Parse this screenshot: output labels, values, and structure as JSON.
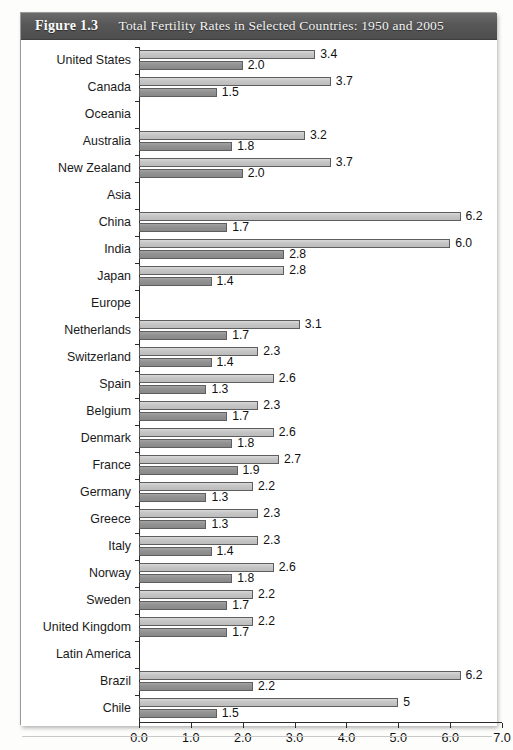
{
  "figure": {
    "number": "Figure 1.3",
    "title": "Total Fertility Rates in Selected Countries: 1950 and 2005"
  },
  "chart_data": {
    "type": "bar",
    "orientation": "horizontal",
    "title": "Total Fertility Rates in Selected Countries: 1950 and 2005",
    "xlabel": "",
    "ylabel": "",
    "xlim": [
      0.0,
      7.0
    ],
    "xticks": [
      "0.0",
      "1.0",
      "2.0",
      "3.0",
      "4.0",
      "5.0",
      "6.0",
      "7.0"
    ],
    "grid": false,
    "legend_position": "bottom",
    "colors": {
      "series_1950_1955": "#c6c6c6",
      "series_2005_2010": "#929292",
      "caption_bar": "#575757",
      "axis": "#2b2b2b"
    },
    "series": [
      {
        "name": "1950–1955",
        "key": "old"
      },
      {
        "name": "2005–2010",
        "key": "new"
      }
    ],
    "categories": [
      "United States",
      "Canada",
      "Oceania",
      "Australia",
      "New Zealand",
      "Asia",
      "China",
      "India",
      "Japan",
      "Europe",
      "Netherlands",
      "Switzerland",
      "Spain",
      "Belgium",
      "Denmark",
      "France",
      "Germany",
      "Greece",
      "Italy",
      "Norway",
      "Sweden",
      "United Kingdom",
      "Latin America",
      "Brazil",
      "Chile"
    ],
    "rows": [
      {
        "label": "United States",
        "group": false,
        "old": 3.4,
        "new": 2.0,
        "old_label": "3.4",
        "new_label": "2.0"
      },
      {
        "label": "Canada",
        "group": false,
        "old": 3.7,
        "new": 1.5,
        "old_label": "3.7",
        "new_label": "1.5"
      },
      {
        "label": "Oceania",
        "group": true,
        "old": null,
        "new": null,
        "old_label": "",
        "new_label": ""
      },
      {
        "label": "Australia",
        "group": false,
        "old": 3.2,
        "new": 1.8,
        "old_label": "3.2",
        "new_label": "1.8"
      },
      {
        "label": "New Zealand",
        "group": false,
        "old": 3.7,
        "new": 2.0,
        "old_label": "3.7",
        "new_label": "2.0"
      },
      {
        "label": "Asia",
        "group": true,
        "old": null,
        "new": null,
        "old_label": "",
        "new_label": ""
      },
      {
        "label": "China",
        "group": false,
        "old": 6.2,
        "new": 1.7,
        "old_label": "6.2",
        "new_label": "1.7"
      },
      {
        "label": "India",
        "group": false,
        "old": 6.0,
        "new": 2.8,
        "old_label": "6.0",
        "new_label": "2.8"
      },
      {
        "label": "Japan",
        "group": false,
        "old": 2.8,
        "new": 1.4,
        "old_label": "2.8",
        "new_label": "1.4"
      },
      {
        "label": "Europe",
        "group": true,
        "old": null,
        "new": null,
        "old_label": "",
        "new_label": ""
      },
      {
        "label": "Netherlands",
        "group": false,
        "old": 3.1,
        "new": 1.7,
        "old_label": "3.1",
        "new_label": "1.7"
      },
      {
        "label": "Switzerland",
        "group": false,
        "old": 2.3,
        "new": 1.4,
        "old_label": "2.3",
        "new_label": "1.4"
      },
      {
        "label": "Spain",
        "group": false,
        "old": 2.6,
        "new": 1.3,
        "old_label": "2.6",
        "new_label": "1.3"
      },
      {
        "label": "Belgium",
        "group": false,
        "old": 2.3,
        "new": 1.7,
        "old_label": "2.3",
        "new_label": "1.7"
      },
      {
        "label": "Denmark",
        "group": false,
        "old": 2.6,
        "new": 1.8,
        "old_label": "2.6",
        "new_label": "1.8"
      },
      {
        "label": "France",
        "group": false,
        "old": 2.7,
        "new": 1.9,
        "old_label": "2.7",
        "new_label": "1.9"
      },
      {
        "label": "Germany",
        "group": false,
        "old": 2.2,
        "new": 1.3,
        "old_label": "2.2",
        "new_label": "1.3"
      },
      {
        "label": "Greece",
        "group": false,
        "old": 2.3,
        "new": 1.3,
        "old_label": "2.3",
        "new_label": "1.3"
      },
      {
        "label": "Italy",
        "group": false,
        "old": 2.3,
        "new": 1.4,
        "old_label": "2.3",
        "new_label": "1.4"
      },
      {
        "label": "Norway",
        "group": false,
        "old": 2.6,
        "new": 1.8,
        "old_label": "2.6",
        "new_label": "1.8"
      },
      {
        "label": "Sweden",
        "group": false,
        "old": 2.2,
        "new": 1.7,
        "old_label": "2.2",
        "new_label": "1.7"
      },
      {
        "label": "United Kingdom",
        "group": false,
        "old": 2.2,
        "new": 1.7,
        "old_label": "2.2",
        "new_label": "1.7"
      },
      {
        "label": "Latin America",
        "group": true,
        "old": null,
        "new": null,
        "old_label": "",
        "new_label": ""
      },
      {
        "label": "Brazil",
        "group": false,
        "old": 6.2,
        "new": 2.2,
        "old_label": "6.2",
        "new_label": "2.2"
      },
      {
        "label": "Chile",
        "group": false,
        "old": 5.0,
        "new": 1.5,
        "old_label": "5",
        "new_label": "1.5"
      }
    ]
  }
}
